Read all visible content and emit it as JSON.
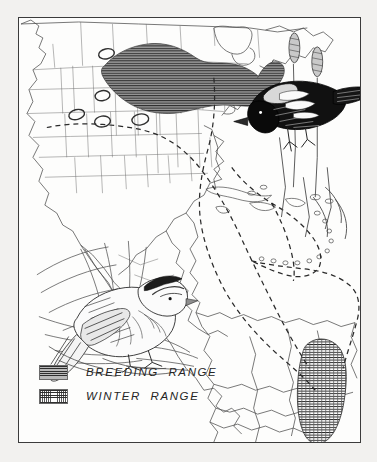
{
  "plate": {
    "title": "Bobolink Range and Migration Map",
    "frame_color": "#3b3b3b",
    "background_color": "#f2f1ef",
    "paper_color": "#fdfdfc"
  },
  "legend": {
    "name": "range-legend",
    "items": [
      {
        "swatch": "breeding-range-swatch",
        "pattern": "horizontal-line-hatch",
        "color": "#8e8e8e",
        "label": "BREEDING  RANGE"
      },
      {
        "swatch": "winter-range-swatch",
        "pattern": "wavy-cross-hatch",
        "color": "#303030",
        "label": "WINTER  RANGE"
      }
    ]
  },
  "map": {
    "name": "americas-range-map",
    "regions": [
      {
        "name": "breeding-range-main",
        "description": "Northern Great Plains through Great Lakes and Northeast",
        "fill": "horizontal-line-hatch"
      },
      {
        "name": "breeding-range-outliers",
        "description": "Five small isolated patches in the western United States",
        "count": 5
      },
      {
        "name": "winter-range-south-america",
        "description": "Northern Argentina, Paraguay, Bolivia and southern Brazil",
        "fill": "wavy-cross-hatch"
      }
    ],
    "migration_routes": [
      {
        "name": "migration-route-western",
        "style": "dashed"
      },
      {
        "name": "migration-route-central",
        "style": "dashed"
      },
      {
        "name": "migration-route-caribbean",
        "style": "dashed"
      },
      {
        "name": "migration-route-atlantic",
        "style": "dashed"
      },
      {
        "name": "migration-route-eastern",
        "style": "dashed"
      }
    ]
  },
  "illustrations": [
    {
      "name": "male-bobolink-illustration",
      "subject": "Male bobolink in breeding plumage perched on cattail stems",
      "position": "upper-right"
    },
    {
      "name": "female-bobolink-illustration",
      "subject": "Female bobolink perched among grass stems",
      "position": "lower-left"
    }
  ]
}
